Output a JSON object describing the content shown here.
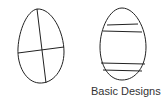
{
  "caption": "Basic Designs",
  "colors": {
    "stroke": "#222222",
    "background": "#ffffff",
    "text": "#333333"
  },
  "diagram": {
    "eggs": [
      {
        "id": "egg-quartered",
        "design": "cross dividing egg into four sections"
      },
      {
        "id": "egg-striped",
        "design": "two pairs of horizontal bands"
      }
    ]
  }
}
